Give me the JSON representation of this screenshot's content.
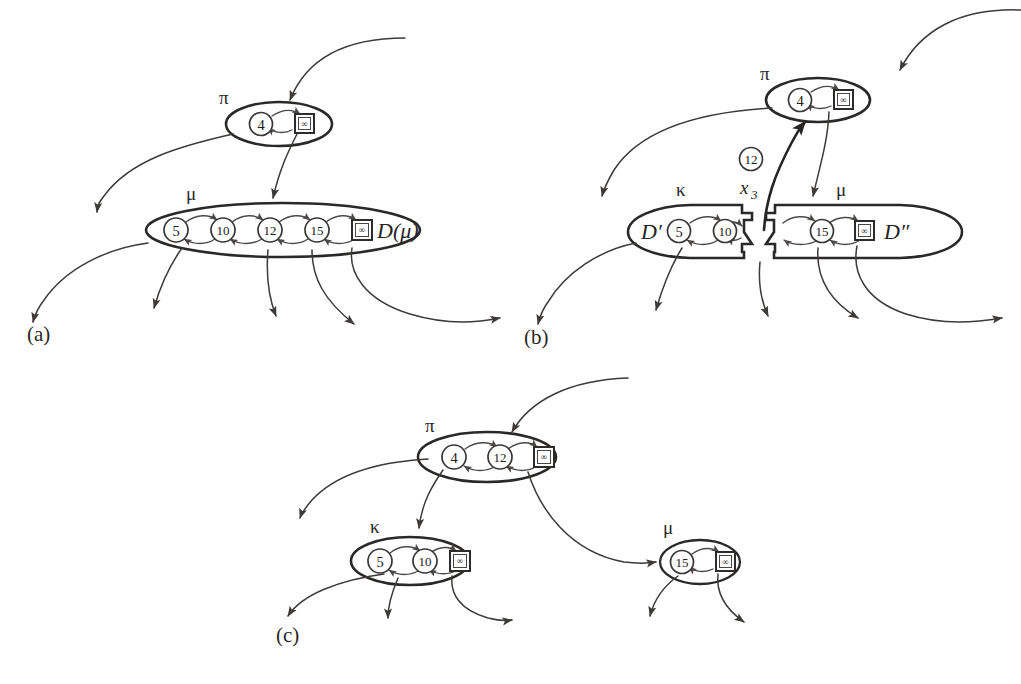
{
  "figure": {
    "background_color": "#ffffff",
    "ink_color": "#2b2928",
    "width": 1021,
    "height": 684,
    "nil_glyph": "∞"
  },
  "panels": [
    {
      "id": "a",
      "label": "(a)",
      "sets": [
        {
          "id": "pi",
          "greek_label": "π",
          "set_label": "",
          "nodes": [
            "4"
          ],
          "has_nil": true,
          "split": false
        },
        {
          "id": "mu",
          "greek_label": "μ",
          "set_label": "D(μ)",
          "nodes": [
            "5",
            "10",
            "12",
            "15"
          ],
          "has_nil": true,
          "split": false
        }
      ]
    },
    {
      "id": "b",
      "label": "(b)",
      "floating_node": "12",
      "key_label": "x",
      "key_subscript": "3",
      "sets": [
        {
          "id": "pi",
          "greek_label": "π",
          "set_label": "",
          "nodes": [
            "4"
          ],
          "has_nil": true,
          "split": false
        },
        {
          "id": "kappa",
          "greek_label": "κ",
          "set_label": "D′",
          "nodes": [
            "5",
            "10"
          ],
          "has_nil": false,
          "split": true
        },
        {
          "id": "mu",
          "greek_label": "μ",
          "set_label": "D″",
          "nodes": [
            "15"
          ],
          "has_nil": true,
          "split": true
        }
      ]
    },
    {
      "id": "c",
      "label": "(c)",
      "sets": [
        {
          "id": "pi",
          "greek_label": "π",
          "set_label": "",
          "nodes": [
            "4",
            "12"
          ],
          "has_nil": true,
          "split": false
        },
        {
          "id": "kappa",
          "greek_label": "κ",
          "set_label": "",
          "nodes": [
            "5",
            "10"
          ],
          "has_nil": true,
          "split": false
        },
        {
          "id": "mu",
          "greek_label": "μ",
          "set_label": "",
          "nodes": [
            "15"
          ],
          "has_nil": true,
          "split": false
        }
      ]
    }
  ]
}
